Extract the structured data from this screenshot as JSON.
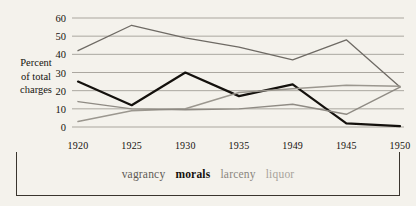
{
  "chart_data": {
    "type": "line",
    "title": "",
    "xlabel": "",
    "ylabel": "Percent of total charges",
    "ylabel_lines": [
      "Percent",
      "of total",
      "charges"
    ],
    "categories": [
      "1920",
      "1925",
      "1930",
      "1935",
      "1949",
      "1945",
      "1950"
    ],
    "ylim": [
      0,
      60
    ],
    "yticks": [
      0,
      10,
      20,
      30,
      40,
      50,
      60
    ],
    "grid": true,
    "legend_position": "bottom",
    "series": [
      {
        "name": "vagrancy",
        "color": "#6e6a64",
        "width": 1.3,
        "values": [
          42,
          56,
          49,
          44,
          37,
          48,
          22
        ]
      },
      {
        "name": "morals",
        "color": "#14110d",
        "width": 2.2,
        "values": [
          25,
          12,
          30,
          17,
          23.5,
          2,
          0.5
        ]
      },
      {
        "name": "larceny",
        "color": "#9b978f",
        "width": 1.5,
        "values": [
          3,
          9,
          10,
          19,
          21,
          23,
          22.5
        ]
      },
      {
        "name": "liquor",
        "color": "#8f8b84",
        "width": 1.4,
        "values": [
          14,
          10,
          9.5,
          10,
          12.5,
          7,
          22
        ]
      }
    ]
  },
  "legend": {
    "items": [
      {
        "label": "vagrancy",
        "color": "#5e5a54",
        "bold": false
      },
      {
        "label": "morals",
        "color": "#14110d",
        "bold": true
      },
      {
        "label": "larceny",
        "color": "#8a867e",
        "bold": false
      },
      {
        "label": "liquor",
        "color": "#a7a39b",
        "bold": false
      }
    ]
  },
  "colors": {
    "background": "#f4f2ec",
    "gridline": "#8b8780",
    "axis_text": "#16130f",
    "frame": "#3a352e"
  }
}
